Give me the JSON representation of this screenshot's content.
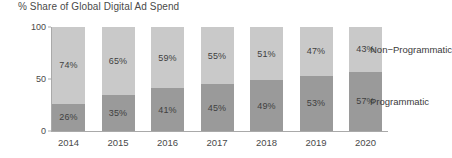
{
  "chart_data": {
    "type": "bar",
    "title": "% Share of Global Digital Ad Spend",
    "xlabel": "",
    "ylabel": "",
    "ylim": [
      0,
      100
    ],
    "yticks": [
      0,
      50,
      100
    ],
    "grid": false,
    "stacked": true,
    "legend_position": "right-direct-label",
    "categories": [
      "2014",
      "2015",
      "2016",
      "2017",
      "2018",
      "2019",
      "2020"
    ],
    "series": [
      {
        "name": "Programmatic",
        "color": "#9a9a9a",
        "values": [
          26,
          35,
          41,
          45,
          49,
          53,
          57
        ],
        "labels": [
          "26%",
          "35%",
          "41%",
          "45%",
          "49%",
          "53%",
          "57%"
        ]
      },
      {
        "name": "Non-Programmatic",
        "color": "#c9c9c9",
        "values": [
          74,
          65,
          59,
          55,
          51,
          47,
          43
        ],
        "labels": [
          "74%",
          "65%",
          "59%",
          "55%",
          "51%",
          "47%",
          "43%"
        ]
      }
    ]
  },
  "axis": {
    "y_tick_labels": [
      "100",
      "50",
      "0"
    ]
  },
  "legend": {
    "non_programmatic": "Non−Programmatic",
    "programmatic": "Programmatic"
  },
  "colors": {
    "non_programmatic": "#c9c9c9",
    "programmatic": "#9a9a9a",
    "axis": "#a9a9a9",
    "text": "#3a3a3a",
    "background": "#ffffff"
  }
}
